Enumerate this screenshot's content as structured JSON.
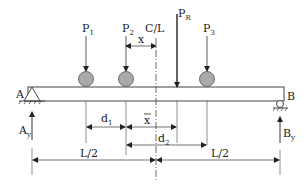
{
  "diagram": {
    "type": "simply supported beam with moving loads",
    "supports": {
      "left": {
        "label": "A",
        "type": "pin",
        "reaction": "A",
        "reaction_sub": "y"
      },
      "right": {
        "label": "B",
        "type": "roller",
        "reaction": "B",
        "reaction_sub": "y"
      }
    },
    "loads": [
      {
        "label": "P",
        "sub": "1"
      },
      {
        "label": "P",
        "sub": "2"
      },
      {
        "label": "P",
        "sub": "3"
      }
    ],
    "resultant": {
      "label": "P",
      "sub": "R"
    },
    "centerline": {
      "label": "C/L"
    },
    "dimensions": {
      "x": "x",
      "xbar": "x",
      "d1": {
        "label": "d",
        "sub": "1"
      },
      "d2": {
        "label": "d",
        "sub": "2"
      },
      "half_left": "L/2",
      "half_right": "L/2"
    },
    "colors": {
      "line": "#333333",
      "wheel": "#a9a9a9",
      "wheel_stroke": "#555555"
    }
  }
}
